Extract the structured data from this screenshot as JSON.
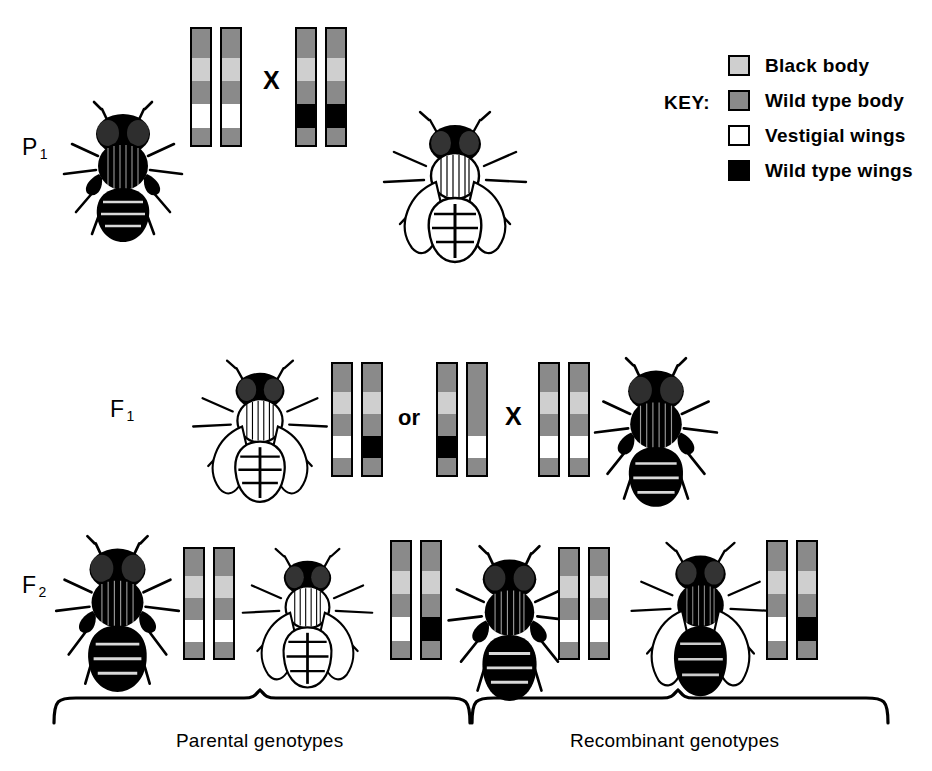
{
  "diagram": {
    "title_visible": false,
    "generations": [
      {
        "id": "p1",
        "label": "P",
        "subscript": "1",
        "cross_symbol": "X"
      },
      {
        "id": "f1",
        "label": "F",
        "subscript": "1",
        "cross_symbol": "X",
        "or_word": "or"
      },
      {
        "id": "f2",
        "label": "F",
        "subscript": "2"
      }
    ],
    "key": {
      "title": "KEY:",
      "entries": [
        {
          "label": "Black body",
          "color": "#cfcfcf",
          "swatch": "light-gray-swatch"
        },
        {
          "label": "Wild type body",
          "color": "#8a8a8a",
          "swatch": "medium-gray-swatch"
        },
        {
          "label": "Vestigial wings",
          "color": "#ffffff",
          "swatch": "white-swatch"
        },
        {
          "label": "Wild type wings",
          "color": "#000000",
          "swatch": "black-swatch"
        }
      ]
    },
    "captions": [
      {
        "text": "Parental genotypes",
        "group": "left"
      },
      {
        "text": "Recombinant genotypes",
        "group": "right"
      }
    ],
    "chromosome_bands_legend_order": [
      "dark",
      "light",
      "dark",
      "white-or-black",
      "dark"
    ],
    "chromosome_groups": [
      {
        "id": "p1-left",
        "generation": "p1",
        "chromosomes": [
          {
            "bands": [
              "dark",
              "light",
              "dark",
              "white",
              "dark"
            ]
          },
          {
            "bands": [
              "dark",
              "light",
              "dark",
              "white",
              "dark"
            ]
          }
        ]
      },
      {
        "id": "p1-right",
        "generation": "p1",
        "chromosomes": [
          {
            "bands": [
              "dark",
              "light",
              "dark",
              "black",
              "dark"
            ]
          },
          {
            "bands": [
              "dark",
              "light",
              "dark",
              "black",
              "dark"
            ]
          }
        ]
      },
      {
        "id": "f1-left",
        "generation": "f1",
        "chromosomes": [
          {
            "bands": [
              "dark",
              "light",
              "dark",
              "white",
              "dark"
            ]
          },
          {
            "bands": [
              "dark",
              "light",
              "dark",
              "black",
              "dark"
            ]
          }
        ]
      },
      {
        "id": "f1-middle",
        "generation": "f1",
        "chromosomes": [
          {
            "bands": [
              "dark",
              "light",
              "dark",
              "black",
              "dark"
            ]
          },
          {
            "bands": [
              "dark",
              "dark",
              "dark",
              "white",
              "dark"
            ]
          }
        ]
      },
      {
        "id": "f1-right",
        "generation": "f1",
        "chromosomes": [
          {
            "bands": [
              "dark",
              "light",
              "dark",
              "white",
              "dark"
            ]
          },
          {
            "bands": [
              "dark",
              "light",
              "dark",
              "white",
              "dark"
            ]
          }
        ]
      },
      {
        "id": "f2-pair-1",
        "generation": "f2",
        "chromosomes": [
          {
            "bands": [
              "dark",
              "light",
              "dark",
              "white",
              "dark"
            ]
          },
          {
            "bands": [
              "dark",
              "light",
              "dark",
              "white",
              "dark"
            ]
          }
        ]
      },
      {
        "id": "f2-pair-2",
        "generation": "f2",
        "chromosomes": [
          {
            "bands": [
              "dark",
              "light",
              "dark",
              "white",
              "dark"
            ]
          },
          {
            "bands": [
              "dark",
              "light",
              "dark",
              "black",
              "dark"
            ]
          }
        ]
      },
      {
        "id": "f2-pair-3",
        "generation": "f2",
        "chromosomes": [
          {
            "bands": [
              "dark",
              "light",
              "dark",
              "white",
              "dark"
            ]
          },
          {
            "bands": [
              "dark",
              "light",
              "dark",
              "white",
              "dark"
            ]
          }
        ]
      },
      {
        "id": "f2-pair-4",
        "generation": "f2",
        "chromosomes": [
          {
            "bands": [
              "dark",
              "light",
              "dark",
              "white",
              "dark"
            ]
          },
          {
            "bands": [
              "dark",
              "light",
              "dark",
              "black",
              "dark"
            ]
          }
        ]
      }
    ],
    "flies": [
      {
        "id": "p1-fly-left",
        "generation": "p1",
        "body": "black",
        "wings": "vestigial"
      },
      {
        "id": "p1-fly-right",
        "generation": "p1",
        "body": "wild-type",
        "wings": "wild-type"
      },
      {
        "id": "f1-fly-left",
        "generation": "f1",
        "body": "wild-type",
        "wings": "wild-type"
      },
      {
        "id": "f1-fly-right",
        "generation": "f1",
        "body": "black",
        "wings": "vestigial"
      },
      {
        "id": "f2-fly-1",
        "generation": "f2",
        "body": "black",
        "wings": "vestigial"
      },
      {
        "id": "f2-fly-2",
        "generation": "f2",
        "body": "wild-type",
        "wings": "wild-type"
      },
      {
        "id": "f2-fly-3",
        "generation": "f2",
        "body": "black",
        "wings": "wild-type"
      },
      {
        "id": "f2-fly-4",
        "generation": "f2",
        "body": "wild-type",
        "wings": "wild-type"
      }
    ]
  }
}
